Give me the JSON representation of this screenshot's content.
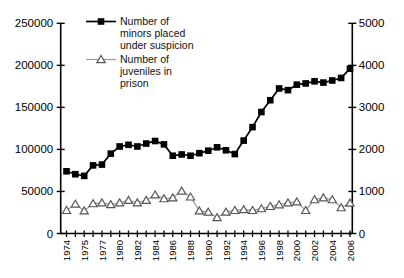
{
  "figure": {
    "background": "#ffffff"
  },
  "chart_data": {
    "type": "line",
    "x": [
      1974,
      1975,
      1976,
      1977,
      1978,
      1979,
      1980,
      1981,
      1982,
      1983,
      1984,
      1985,
      1986,
      1987,
      1988,
      1989,
      1990,
      1991,
      1992,
      1993,
      1994,
      1995,
      1996,
      1997,
      1998,
      1999,
      2000,
      2001,
      2002,
      2003,
      2004,
      2005,
      2006
    ],
    "x_tick_labels": [
      "1974",
      "1975",
      "1977",
      "1980",
      "1982",
      "1984",
      "1986",
      "1988",
      "1990",
      "1992",
      "1994",
      "1996",
      "1998",
      "2000",
      "2002",
      "2004",
      "2006"
    ],
    "x_label_every": 2,
    "left_axis": {
      "min": 0,
      "max": 250000,
      "tick_step": 50000,
      "tick_labels": [
        "0",
        "50000",
        "100000",
        "150000",
        "200000",
        "250000"
      ]
    },
    "right_axis": {
      "min": 0,
      "max": 5000,
      "tick_step": 1000,
      "tick_labels": [
        "0",
        "1000",
        "2000",
        "3000",
        "4000",
        "5000"
      ]
    },
    "axis_color": "#000000",
    "grid": false,
    "series": [
      {
        "name": "Number of minors placed under suspicion",
        "axis": "left",
        "marker": "filled-square",
        "line_color": "#000000",
        "marker_color": "#000000",
        "marker_fill": "#000000",
        "values": [
          74000,
          70500,
          68500,
          81000,
          82000,
          95000,
          103500,
          105500,
          103500,
          107000,
          110000,
          106000,
          92500,
          94000,
          92500,
          95500,
          98500,
          102500,
          99000,
          94500,
          110500,
          126500,
          144500,
          158500,
          172500,
          170500,
          177000,
          178500,
          181000,
          179500,
          182000,
          185000,
          196000
        ]
      },
      {
        "name": "Number of juveniles in prison",
        "axis": "right",
        "marker": "open-triangle",
        "line_color": "#999999",
        "marker_color": "#555555",
        "marker_fill": "#ffffff",
        "values": [
          550,
          700,
          540,
          710,
          730,
          690,
          730,
          790,
          730,
          790,
          920,
          830,
          850,
          1010,
          870,
          540,
          510,
          380,
          510,
          550,
          570,
          550,
          590,
          645,
          685,
          730,
          755,
          550,
          805,
          850,
          805,
          615,
          725
        ]
      }
    ],
    "legend": {
      "position": "top-left",
      "entries": [
        {
          "label_lines": [
            "Number of",
            "minors placed",
            "under suspicion"
          ]
        },
        {
          "label_lines": [
            "Number of",
            "juveniles in",
            "prison"
          ]
        }
      ]
    }
  }
}
